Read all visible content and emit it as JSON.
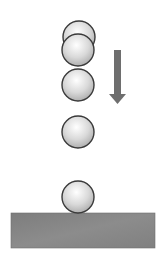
{
  "diagram": {
    "ball_count": 5,
    "motion_direction": "down",
    "colors": {
      "ball_outline": "#3a3a3a",
      "ball_highlight": "#ffffff",
      "ball_shade": "#a8a8a8",
      "arrow": "#6e6e6e",
      "ground": "#858585",
      "background": "#ffffff"
    }
  }
}
